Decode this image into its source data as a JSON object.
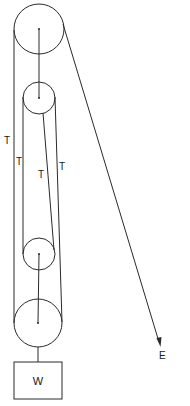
{
  "diagram": {
    "type": "block-and-tackle pulley system",
    "colors": {
      "line": "#2a2a2a",
      "text": "#1a1a1a",
      "background": "#ffffff"
    },
    "pulleys": [
      {
        "name": "top-fixed-large",
        "cx": 39,
        "cy": 29,
        "r": 25
      },
      {
        "name": "top-fixed-small",
        "cx": 39,
        "cy": 98,
        "r": 16
      },
      {
        "name": "bottom-moving-small",
        "cx": 39,
        "cy": 254,
        "r": 16
      },
      {
        "name": "bottom-moving-large",
        "cx": 38,
        "cy": 323,
        "r": 24
      }
    ],
    "weight": {
      "label": "W",
      "x": 14,
      "y": 362,
      "width": 48,
      "height": 37
    },
    "effort": {
      "label": "E"
    },
    "tension_labels": [
      "T",
      "T",
      "T",
      "T"
    ]
  }
}
